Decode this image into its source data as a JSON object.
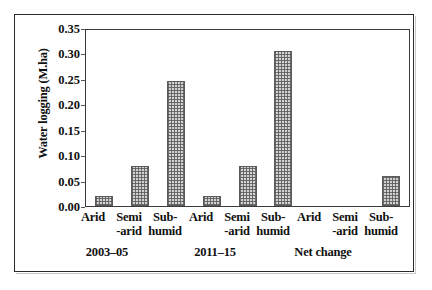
{
  "chart_data": {
    "type": "bar",
    "title": "",
    "xlabel": "",
    "ylabel": "Water logging (M.ha)",
    "ylim": [
      0.0,
      0.35
    ],
    "ytick_labels": [
      "0.35",
      "0.30",
      "0.25",
      "0.20",
      "0.15",
      "0.10",
      "0.05",
      "0.00"
    ],
    "ytick_values": [
      0.35,
      0.3,
      0.25,
      0.2,
      0.15,
      0.1,
      0.05,
      0.0
    ],
    "grid": false,
    "legend": "none",
    "categories": [
      "Arid",
      "Semi -arid",
      "Sub- humid",
      "Arid",
      "Semi -arid",
      "Sub- humid",
      "Arid",
      "Semi -arid",
      "Sub- humid"
    ],
    "category_lines": [
      {
        "line1": "Arid",
        "line2": ""
      },
      {
        "line1": "Semi",
        "line2": "-arid"
      },
      {
        "line1": "Sub-",
        "line2": "humid"
      },
      {
        "line1": "Arid",
        "line2": ""
      },
      {
        "line1": "Semi",
        "line2": "-arid"
      },
      {
        "line1": "Sub-",
        "line2": "humid"
      },
      {
        "line1": "Arid",
        "line2": ""
      },
      {
        "line1": "Semi",
        "line2": "-arid"
      },
      {
        "line1": "Sub-",
        "line2": "humid"
      }
    ],
    "values": [
      0.02,
      0.08,
      0.248,
      0.02,
      0.08,
      0.308,
      0.0,
      0.0,
      0.06
    ],
    "groups": [
      {
        "label": "2003–05",
        "categories": [
          "Arid",
          "Semi -arid",
          "Sub- humid"
        ],
        "values": [
          0.02,
          0.08,
          0.248
        ]
      },
      {
        "label": "2011–15",
        "categories": [
          "Arid",
          "Semi -arid",
          "Sub- humid"
        ],
        "values": [
          0.02,
          0.08,
          0.308
        ]
      },
      {
        "label": "Net change",
        "categories": [
          "Arid",
          "Semi -arid",
          "Sub- humid"
        ],
        "values": [
          0.0,
          0.0,
          0.06
        ]
      }
    ],
    "group_labels": [
      "2003–05",
      "2011–15",
      "Net change"
    ],
    "bar_fill": "#d2d2d2",
    "bar_edge": "#5b5b5b",
    "axis_color": "#3a3a3a",
    "background": "#ffffff"
  }
}
